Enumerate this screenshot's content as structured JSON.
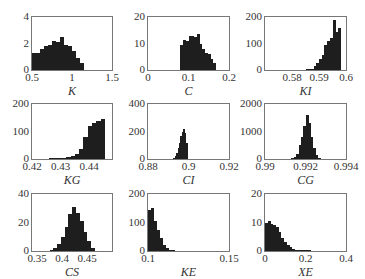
{
  "chart_data": [
    {
      "type": "bar",
      "title": "",
      "xlabel": "K",
      "ylabel": "",
      "xlim": [
        0.5,
        1.5
      ],
      "ylim": [
        0,
        4
      ],
      "xticks": [
        "0.5",
        "1",
        "1.5"
      ],
      "xtick_values": [
        0.5,
        1,
        1.5
      ],
      "yticks": [
        "0",
        "2",
        "4"
      ],
      "ytick_values": [
        0,
        2,
        4
      ],
      "bin_start": 0.5,
      "bin_width": 0.05,
      "values": [
        1.3,
        1.3,
        1.6,
        1.8,
        1.9,
        2.2,
        2.1,
        2.5,
        1.9,
        1.8,
        1.4,
        0.9,
        0.5
      ],
      "grid": false
    },
    {
      "type": "bar",
      "title": "",
      "xlabel": "C",
      "ylabel": "",
      "xlim": [
        0,
        0.2
      ],
      "ylim": [
        0,
        20
      ],
      "xticks": [
        "0",
        "0.1",
        "0.2"
      ],
      "xtick_values": [
        0,
        0.1,
        0.2
      ],
      "yticks": [
        "0",
        "10",
        "20"
      ],
      "ytick_values": [
        0,
        10,
        20
      ],
      "bin_start": 0.08,
      "bin_width": 0.0067,
      "values": [
        9.5,
        11.5,
        11,
        13,
        13,
        12.5,
        13.5,
        10,
        8,
        6.5,
        6,
        4,
        2.5
      ],
      "grid": false
    },
    {
      "type": "bar",
      "title": "",
      "xlabel": "KI",
      "ylabel": "",
      "xlim": [
        0.57,
        0.6
      ],
      "ylim": [
        0,
        200
      ],
      "xticks": [
        "0.58",
        "0.59",
        "0.6"
      ],
      "xtick_values": [
        0.58,
        0.59,
        0.6
      ],
      "yticks": [
        "0",
        "100",
        "200"
      ],
      "ytick_values": [
        0,
        100,
        200
      ],
      "bin_start": 0.585,
      "bin_width": 0.001,
      "values": [
        1,
        3,
        5,
        15,
        25,
        40,
        55,
        95,
        110,
        120,
        190,
        145,
        160
      ],
      "grid": false
    },
    {
      "type": "bar",
      "title": "",
      "xlabel": "KG",
      "ylabel": "",
      "xlim": [
        0.42,
        0.448
      ],
      "ylim": [
        0,
        200
      ],
      "xticks": [
        "0.42",
        "0.43",
        "0.44"
      ],
      "xtick_values": [
        0.42,
        0.43,
        0.44
      ],
      "yticks": [
        "0",
        "100",
        "200"
      ],
      "ytick_values": [
        0,
        100,
        200
      ],
      "bin_start": 0.426,
      "bin_width": 0.0015,
      "values": [
        1,
        2,
        3,
        5,
        8,
        12,
        18,
        35,
        80,
        120,
        130,
        140,
        145
      ],
      "grid": false
    },
    {
      "type": "bar",
      "title": "",
      "xlabel": "CI",
      "ylabel": "",
      "xlim": [
        0.88,
        0.92
      ],
      "ylim": [
        0,
        400
      ],
      "xticks": [
        "0.88",
        "0.9",
        "0.92"
      ],
      "xtick_values": [
        0.88,
        0.9,
        0.92
      ],
      "yticks": [
        "0",
        "200",
        "400"
      ],
      "ytick_values": [
        0,
        200,
        400
      ],
      "bin_start": 0.8925,
      "bin_width": 0.0007,
      "values": [
        5,
        20,
        45,
        80,
        120,
        170,
        200,
        215,
        190,
        120
      ],
      "grid": false
    },
    {
      "type": "bar",
      "title": "",
      "xlabel": "CG",
      "ylabel": "",
      "xlim": [
        0.99,
        0.994
      ],
      "ylim": [
        0,
        2000
      ],
      "xticks": [
        "0.99",
        "0.992",
        "0.994"
      ],
      "xtick_values": [
        0.99,
        0.992,
        0.994
      ],
      "yticks": [
        "0",
        "1000",
        "2000"
      ],
      "ytick_values": [
        0,
        1000,
        2000
      ],
      "bin_start": 0.9913,
      "bin_width": 0.00012,
      "values": [
        20,
        60,
        200,
        500,
        800,
        1200,
        1600,
        1300,
        800,
        400,
        150,
        50
      ],
      "grid": false
    },
    {
      "type": "bar",
      "title": "",
      "xlabel": "CS",
      "ylabel": "",
      "xlim": [
        0.34,
        0.5
      ],
      "ylim": [
        0,
        40
      ],
      "xticks": [
        "0.35",
        "0.4",
        "0.45"
      ],
      "xtick_values": [
        0.35,
        0.4,
        0.45
      ],
      "yticks": [
        "0",
        "20",
        "40"
      ],
      "ytick_values": [
        0,
        20,
        40
      ],
      "bin_start": 0.375,
      "bin_width": 0.0075,
      "values": [
        1,
        2,
        5,
        10,
        17,
        26,
        31,
        27,
        21,
        13,
        7,
        2
      ],
      "grid": false
    },
    {
      "type": "bar",
      "title": "",
      "xlabel": "KE",
      "ylabel": "",
      "xlim": [
        0.1,
        0.15
      ],
      "ylim": [
        0,
        200
      ],
      "xticks": [
        "0.1",
        "0.15"
      ],
      "xtick_values": [
        0.1,
        0.15
      ],
      "yticks": [
        "0",
        "100",
        "200"
      ],
      "ytick_values": [
        0,
        100,
        200
      ],
      "bin_start": 0.1,
      "bin_width": 0.0018,
      "values": [
        145,
        150,
        105,
        75,
        45,
        20,
        10,
        4,
        1
      ],
      "grid": false
    },
    {
      "type": "bar",
      "title": "",
      "xlabel": "XE",
      "ylabel": "",
      "xlim": [
        0,
        0.4
      ],
      "ylim": [
        0,
        20
      ],
      "xticks": [
        "0",
        "0.2",
        "0.4"
      ],
      "xtick_values": [
        0,
        0.2,
        0.4
      ],
      "yticks": [
        "0",
        "10",
        "20"
      ],
      "ytick_values": [
        0,
        10,
        20
      ],
      "bin_start": 0,
      "bin_width": 0.0133,
      "values": [
        9.8,
        10.5,
        9.5,
        9.2,
        8.5,
        6.5,
        4.5,
        3,
        2,
        1.5,
        0.8,
        0.4,
        0.3,
        0.2,
        0.1,
        0.3,
        0.1
      ],
      "grid": false
    }
  ],
  "layout": {
    "panels": [
      {
        "x": 31,
        "y": 16,
        "w": 82,
        "h": 55
      },
      {
        "x": 147,
        "y": 16,
        "w": 83,
        "h": 55
      },
      {
        "x": 264,
        "y": 16,
        "w": 83,
        "h": 55
      },
      {
        "x": 31,
        "y": 103,
        "w": 82,
        "h": 57
      },
      {
        "x": 147,
        "y": 103,
        "w": 83,
        "h": 57
      },
      {
        "x": 264,
        "y": 103,
        "w": 83,
        "h": 57
      },
      {
        "x": 31,
        "y": 193,
        "w": 82,
        "h": 59
      },
      {
        "x": 147,
        "y": 193,
        "w": 83,
        "h": 59
      },
      {
        "x": 264,
        "y": 193,
        "w": 83,
        "h": 59
      }
    ]
  }
}
